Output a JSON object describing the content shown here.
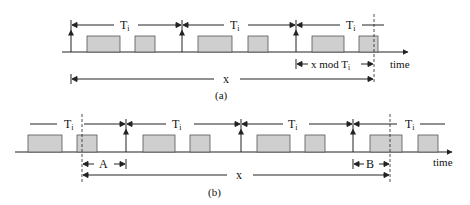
{
  "colors": {
    "line": "#222222",
    "box_fill": "#cfcfcf",
    "box_stroke": "#555555",
    "background": "#ffffff"
  },
  "diagram_a": {
    "caption": "(a)",
    "axis_label": "time",
    "period_label": "T",
    "period_subscript": "i",
    "total_label": "x",
    "remainder_label": "x mod T",
    "remainder_subscript": "i"
  },
  "diagram_b": {
    "caption": "(b)",
    "axis_label": "time",
    "period_label": "T",
    "period_subscript": "i",
    "total_label": "x",
    "offset_start_label": "A",
    "offset_end_label": "B"
  }
}
